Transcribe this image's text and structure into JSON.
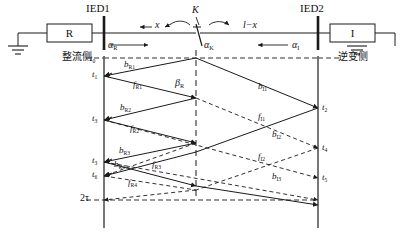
{
  "diagram": {
    "title_type": "traveling-wave lattice diagram",
    "terminals": {
      "rectifier_box_label": "R",
      "inverter_box_label": "I",
      "rectifier_side_text": "整流侧",
      "inverter_side_text": "逆变侧"
    },
    "measurement_points": {
      "left": "IED1",
      "right": "IED2"
    },
    "fault": {
      "marker": "K",
      "left_distance": "x",
      "right_distance": "l−x"
    },
    "angles": {
      "rectifier": {
        "base": "α",
        "sub": "R"
      },
      "fault": {
        "base": "α",
        "sub": "K"
      },
      "inverter": {
        "base": "α",
        "sub": "I"
      },
      "beta_rectifier": {
        "base": "β",
        "sub": "R"
      }
    },
    "time_axis_left": [
      {
        "base": "t",
        "sub": "0"
      },
      {
        "base": "t",
        "sub": "1"
      },
      {
        "base": "t",
        "sub": "3"
      },
      {
        "base": "t",
        "sub": "3"
      },
      {
        "base": "t",
        "sub": "6"
      }
    ],
    "time_axis_right": [
      {
        "base": "t",
        "sub": "2"
      },
      {
        "base": "t",
        "sub": "4"
      },
      {
        "base": "t",
        "sub": "5"
      }
    ],
    "period_label": {
      "base": "2",
      "sub": "τ"
    },
    "period_label_plain": "2τ",
    "wave_labels_rectifier": [
      {
        "base": "b",
        "sub": "R1"
      },
      {
        "base": "f",
        "sub": "R1"
      },
      {
        "base": "b",
        "sub": "R2"
      },
      {
        "base": "f",
        "sub": "R2"
      },
      {
        "base": "b",
        "sub": "R3"
      },
      {
        "base": "b",
        "sub": "R4"
      },
      {
        "base": "f",
        "sub": "R3"
      },
      {
        "base": "f",
        "sub": "R4"
      }
    ],
    "wave_labels_inverter": [
      {
        "base": "b",
        "sub": "I1"
      },
      {
        "base": "f",
        "sub": "I1"
      },
      {
        "base": "b",
        "sub": "I2"
      },
      {
        "base": "f",
        "sub": "I2"
      },
      {
        "base": "b",
        "sub": "I3"
      }
    ],
    "colors": {
      "line": "#1a1a1a",
      "background": "#ffffff",
      "axis": "#555555"
    }
  }
}
